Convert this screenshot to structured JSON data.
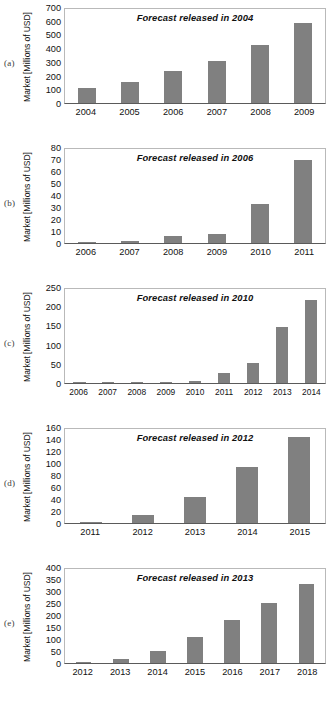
{
  "figure": {
    "ylabel": "Market [Millions of USD]",
    "panel_tags": [
      "(a)",
      "(b)",
      "(c)",
      "(d)",
      "(e)"
    ],
    "bar_color": "#808080",
    "axis_color": "#5a5a5a",
    "frame_color": "#b9b9b9",
    "footer_note": ""
  },
  "chart_data": [
    {
      "type": "bar",
      "panel": "(a)",
      "title": "Forecast released in 2004",
      "xlabel": "",
      "ylabel": "Market [Millions of USD]",
      "categories": [
        "2004",
        "2005",
        "2006",
        "2007",
        "2008",
        "2009"
      ],
      "values": [
        110,
        160,
        240,
        310,
        435,
        595
      ],
      "ylim": [
        0,
        700
      ],
      "yticks": [
        0,
        100,
        200,
        300,
        400,
        500,
        600,
        700
      ],
      "grid": false,
      "legend": "none"
    },
    {
      "type": "bar",
      "panel": "(b)",
      "title": "Forecast released in 2006",
      "xlabel": "",
      "ylabel": "Market [Millions of USD]",
      "categories": [
        "2006",
        "2007",
        "2008",
        "2009",
        "2010",
        "2011"
      ],
      "values": [
        0.5,
        1.5,
        6,
        8,
        33.5,
        71
      ],
      "ylim": [
        0,
        80
      ],
      "yticks": [
        0,
        10,
        20,
        30,
        40,
        50,
        60,
        70,
        80
      ],
      "grid": false,
      "legend": "none"
    },
    {
      "type": "bar",
      "panel": "(c)",
      "title": "Forecast released in 2010",
      "xlabel": "",
      "ylabel": "Market [Millions of USD]",
      "categories": [
        "2006",
        "2007",
        "2008",
        "2009",
        "2010",
        "2011",
        "2012",
        "2013",
        "2014"
      ],
      "values": [
        2,
        2,
        3,
        1.5,
        5,
        26,
        52,
        150,
        221
      ],
      "ylim": [
        0,
        250
      ],
      "yticks": [
        0,
        50,
        100,
        150,
        200,
        250
      ],
      "grid": false,
      "legend": "none"
    },
    {
      "type": "bar",
      "panel": "(d)",
      "title": "Forecast released in 2012",
      "xlabel": "",
      "ylabel": "Market [Millions of USD]",
      "categories": [
        "2011",
        "2012",
        "2013",
        "2014",
        "2015"
      ],
      "values": [
        1.5,
        14,
        44,
        95,
        147
      ],
      "ylim": [
        0,
        160
      ],
      "yticks": [
        0,
        20,
        40,
        60,
        80,
        100,
        120,
        140,
        160
      ],
      "grid": false,
      "legend": "none"
    },
    {
      "type": "bar",
      "panel": "(e)",
      "title": "Forecast released in 2013",
      "xlabel": "",
      "ylabel": "Market [Millions of USD]",
      "categories": [
        "2012",
        "2013",
        "2014",
        "2015",
        "2016",
        "2017",
        "2018"
      ],
      "values": [
        1,
        16,
        50,
        112,
        182,
        255,
        338
      ],
      "ylim": [
        0,
        400
      ],
      "yticks": [
        0,
        50,
        100,
        150,
        200,
        250,
        300,
        350,
        400
      ],
      "grid": false,
      "legend": "none"
    }
  ]
}
